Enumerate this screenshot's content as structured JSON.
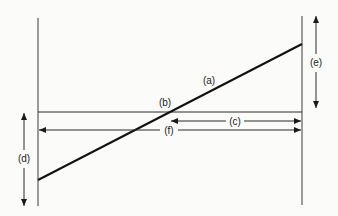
{
  "diagram": {
    "labels": {
      "a": "(a)",
      "b": "(b)",
      "c": "(c)",
      "d": "(d)",
      "e": "(e)",
      "f": "(f)"
    },
    "colors": {
      "line": "#1a1a1a",
      "background": "#fbfbfa"
    },
    "elements": [
      {
        "id": "left-vertical-line",
        "type": "line",
        "x1": 38,
        "y1": 18,
        "x2": 38,
        "y2": 206
      },
      {
        "id": "right-vertical-line",
        "type": "line",
        "x1": 302,
        "y1": 16,
        "x2": 302,
        "y2": 205
      },
      {
        "id": "horizontal-line",
        "type": "line",
        "x1": 38,
        "y1": 112,
        "x2": 302,
        "y2": 112,
        "label": "(b)"
      },
      {
        "id": "diagonal-line",
        "type": "line",
        "x1": 38,
        "y1": 180,
        "x2": 302,
        "y2": 44,
        "label": "(a)"
      },
      {
        "id": "arrow-c",
        "type": "double-arrow",
        "x1": 170,
        "y1": 121,
        "x2": 302,
        "y2": 121,
        "label": "(c)"
      },
      {
        "id": "arrow-f",
        "type": "double-arrow",
        "x1": 38,
        "y1": 130,
        "x2": 302,
        "y2": 130,
        "label": "(f)"
      },
      {
        "id": "arrow-d",
        "type": "double-arrow",
        "x1": 24,
        "y1": 113,
        "x2": 24,
        "y2": 206,
        "label": "(d)"
      },
      {
        "id": "arrow-e",
        "type": "double-arrow",
        "x1": 316,
        "y1": 16,
        "x2": 316,
        "y2": 108,
        "label": "(e)"
      }
    ]
  }
}
